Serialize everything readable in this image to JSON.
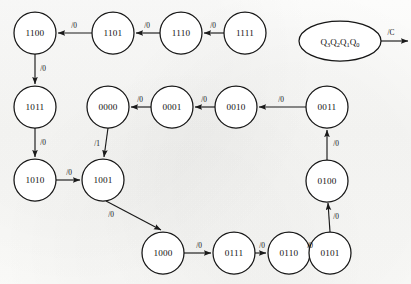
{
  "diagram": {
    "type": "state-transition-diagram",
    "colors": {
      "background": "#fbfbfa",
      "node_fill": "#ffffff",
      "stroke": "#161616",
      "text": "#101010"
    },
    "legend": {
      "state_vector": "Q3Q2Q1Q0",
      "state_vector_base": "Q",
      "subscripts": [
        "3",
        "2",
        "1",
        "0"
      ],
      "output_label": "/C"
    },
    "nodes": [
      {
        "id": "n1100",
        "label": "1100",
        "cx": 35,
        "cy": 33,
        "r": 21
      },
      {
        "id": "n1101",
        "label": "1101",
        "cx": 113,
        "cy": 33,
        "r": 21
      },
      {
        "id": "n1110",
        "label": "1110",
        "cx": 181,
        "cy": 33,
        "r": 21
      },
      {
        "id": "n1111",
        "label": "1111",
        "cx": 245,
        "cy": 33,
        "r": 21
      },
      {
        "id": "n1011",
        "label": "1011",
        "cx": 35,
        "cy": 107,
        "r": 21
      },
      {
        "id": "n0000",
        "label": "0000",
        "cx": 108,
        "cy": 107,
        "r": 21
      },
      {
        "id": "n0001",
        "label": "0001",
        "cx": 172,
        "cy": 107,
        "r": 21
      },
      {
        "id": "n0010",
        "label": "0010",
        "cx": 236,
        "cy": 107,
        "r": 21
      },
      {
        "id": "n0011",
        "label": "0011",
        "cx": 327,
        "cy": 107,
        "r": 21
      },
      {
        "id": "n1010",
        "label": "1010",
        "cx": 35,
        "cy": 180,
        "r": 21
      },
      {
        "id": "n1001",
        "label": "1001",
        "cx": 103,
        "cy": 180,
        "r": 21
      },
      {
        "id": "n0100",
        "label": "0100",
        "cx": 327,
        "cy": 181,
        "r": 21
      },
      {
        "id": "n1000",
        "label": "1000",
        "cx": 163,
        "cy": 253,
        "r": 21
      },
      {
        "id": "n0111",
        "label": "0111",
        "cx": 234,
        "cy": 253,
        "r": 21
      },
      {
        "id": "n0110",
        "label": "0110",
        "cx": 289,
        "cy": 253,
        "r": 21
      },
      {
        "id": "n0101",
        "label": "0101",
        "cx": 330,
        "cy": 253,
        "r": 21
      }
    ],
    "legend_node": {
      "id": "legend-ellipse",
      "cx": 340,
      "cy": 41,
      "rx": 41,
      "ry": 20
    },
    "edges": [
      {
        "id": "e-1111-1110",
        "from": "1111",
        "to": "1110",
        "label": "/0",
        "lx": 213,
        "ly": 25
      },
      {
        "id": "e-1110-1101",
        "from": "1110",
        "to": "1101",
        "label": "/0",
        "lx": 147,
        "ly": 25
      },
      {
        "id": "e-1101-1100",
        "from": "1101",
        "to": "1100",
        "label": "/0",
        "lx": 74,
        "ly": 25
      },
      {
        "id": "e-1100-1011",
        "from": "1100",
        "to": "1011",
        "label": "/0",
        "lx": 43,
        "ly": 68
      },
      {
        "id": "e-1011-1010",
        "from": "1011",
        "to": "1010",
        "label": "/0",
        "lx": 43,
        "ly": 142
      },
      {
        "id": "e-1010-1001",
        "from": "1010",
        "to": "1001",
        "label": "/0",
        "lx": 69,
        "ly": 172
      },
      {
        "id": "e-1001-1000",
        "from": "1001",
        "to": "1000",
        "label": "/0",
        "lx": 111,
        "ly": 214
      },
      {
        "id": "e-1000-0111",
        "from": "1000",
        "to": "0111",
        "label": "/0",
        "lx": 199,
        "ly": 245
      },
      {
        "id": "e-0111-0110",
        "from": "0111",
        "to": "0110",
        "label": "/0",
        "lx": 262,
        "ly": 245
      },
      {
        "id": "e-0110-0101",
        "from": "0110",
        "to": "0101",
        "label": "/0",
        "lx": 310,
        "ly": 245
      },
      {
        "id": "e-0101-0100",
        "from": "0101",
        "to": "0100",
        "label": "/0",
        "lx": 335,
        "ly": 216
      },
      {
        "id": "e-0100-0011",
        "from": "0100",
        "to": "0011",
        "label": "/0",
        "lx": 335,
        "ly": 143
      },
      {
        "id": "e-0011-0010",
        "from": "0011",
        "to": "0010",
        "label": "/0",
        "lx": 281,
        "ly": 99
      },
      {
        "id": "e-0010-0001",
        "from": "0010",
        "to": "0001",
        "label": "/0",
        "lx": 204,
        "ly": 99
      },
      {
        "id": "e-0001-0000",
        "from": "0001",
        "to": "0000",
        "label": "/0",
        "lx": 140,
        "ly": 99
      },
      {
        "id": "e-0000-1001",
        "from": "0000",
        "to": "1001",
        "label": "/1",
        "lx": 97,
        "ly": 143
      }
    ],
    "legend_output_edge": {
      "id": "legend-output-arrow",
      "x1": 381,
      "y1": 41,
      "x2": 409,
      "y2": 41
    }
  }
}
